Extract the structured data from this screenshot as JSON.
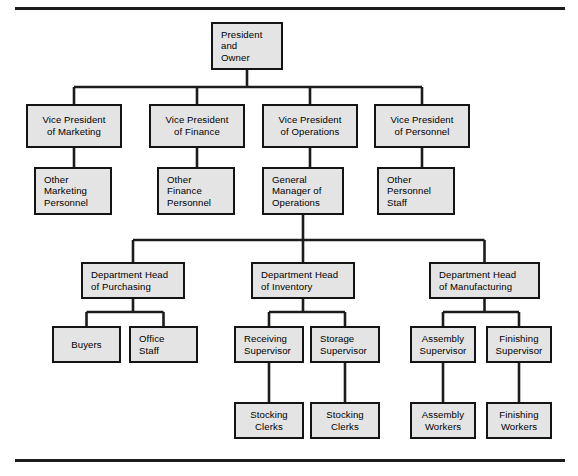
{
  "page": {
    "background": "#ffffff",
    "box_fill": "#e4e4e4",
    "box_stroke": "#141414",
    "line_color": "#1c1c1c",
    "text_color": "#000000"
  },
  "rules": [
    {
      "name": "top-rule",
      "x": 15,
      "y": 7,
      "width": 550,
      "height": 3
    },
    {
      "name": "bottom-rule",
      "x": 15,
      "y": 459,
      "width": 550,
      "height": 3
    }
  ],
  "chart_data": {
    "type": "diagram",
    "diagram_type": "organization-chart",
    "orientation": "top-down",
    "levels": 6,
    "node_count": 22,
    "nodes": [
      {
        "id": "president",
        "label_lines": [
          "President",
          "and",
          "Owner"
        ],
        "align": "left",
        "x": 211,
        "y": 22,
        "w": 72,
        "h": 48,
        "level": 0
      },
      {
        "id": "vp-marketing",
        "label_lines": [
          "Vice President",
          "of Marketing"
        ],
        "align": "center",
        "x": 26,
        "y": 104,
        "w": 96,
        "h": 44,
        "level": 1
      },
      {
        "id": "vp-finance",
        "label_lines": [
          "Vice President",
          "of Finance"
        ],
        "align": "center",
        "x": 149,
        "y": 104,
        "w": 96,
        "h": 44,
        "level": 1
      },
      {
        "id": "vp-operations",
        "label_lines": [
          "Vice President",
          "of Operations"
        ],
        "align": "center",
        "x": 262,
        "y": 104,
        "w": 96,
        "h": 44,
        "level": 1
      },
      {
        "id": "vp-personnel",
        "label_lines": [
          "Vice President",
          "of Personnel"
        ],
        "align": "center",
        "x": 374,
        "y": 104,
        "w": 96,
        "h": 44,
        "level": 1
      },
      {
        "id": "other-marketing",
        "label_lines": [
          "Other",
          "Marketing",
          "Personnel"
        ],
        "align": "left",
        "x": 34,
        "y": 167,
        "w": 78,
        "h": 48,
        "level": 2
      },
      {
        "id": "other-finance",
        "label_lines": [
          "Other",
          "Finance",
          "Personnel"
        ],
        "align": "left",
        "x": 157,
        "y": 167,
        "w": 78,
        "h": 48,
        "level": 2
      },
      {
        "id": "gm-operations",
        "label_lines": [
          "General",
          "Manager of",
          "Operations"
        ],
        "align": "left",
        "x": 262,
        "y": 167,
        "w": 82,
        "h": 48,
        "level": 2
      },
      {
        "id": "other-personnel",
        "label_lines": [
          "Other",
          "Personnel",
          "Staff"
        ],
        "align": "left",
        "x": 377,
        "y": 167,
        "w": 78,
        "h": 48,
        "level": 2
      },
      {
        "id": "dh-purchasing",
        "label_lines": [
          "Department Head",
          "of Purchasing"
        ],
        "align": "left",
        "x": 81,
        "y": 262,
        "w": 104,
        "h": 37,
        "level": 3
      },
      {
        "id": "dh-inventory",
        "label_lines": [
          "Department Head",
          "of Inventory"
        ],
        "align": "left",
        "x": 251,
        "y": 262,
        "w": 104,
        "h": 37,
        "level": 3
      },
      {
        "id": "dh-manufacturing",
        "label_lines": [
          "Department Head",
          "of Manufacturing"
        ],
        "align": "left",
        "x": 429,
        "y": 262,
        "w": 111,
        "h": 37,
        "level": 3
      },
      {
        "id": "buyers",
        "label_lines": [
          "Buyers"
        ],
        "align": "center",
        "x": 52,
        "y": 326,
        "w": 69,
        "h": 37,
        "level": 4
      },
      {
        "id": "office-staff",
        "label_lines": [
          "Office",
          "Staff"
        ],
        "align": "left",
        "x": 129,
        "y": 326,
        "w": 69,
        "h": 37,
        "level": 4
      },
      {
        "id": "receiving-sup",
        "label_lines": [
          "Receiving",
          "Supervisor"
        ],
        "align": "left",
        "x": 234,
        "y": 326,
        "w": 70,
        "h": 37,
        "level": 4
      },
      {
        "id": "storage-sup",
        "label_lines": [
          "Storage",
          "Supervisor"
        ],
        "align": "left",
        "x": 310,
        "y": 326,
        "w": 70,
        "h": 37,
        "level": 4
      },
      {
        "id": "assembly-sup",
        "label_lines": [
          "Assembly",
          "Supervisor"
        ],
        "align": "center",
        "x": 410,
        "y": 326,
        "w": 66,
        "h": 37,
        "level": 4
      },
      {
        "id": "finishing-sup",
        "label_lines": [
          "Finishing",
          "Supervisor"
        ],
        "align": "center",
        "x": 486,
        "y": 326,
        "w": 66,
        "h": 37,
        "level": 4
      },
      {
        "id": "stocking-clerks-1",
        "label_lines": [
          "Stocking",
          "Clerks"
        ],
        "align": "center",
        "x": 234,
        "y": 402,
        "w": 70,
        "h": 37,
        "level": 5
      },
      {
        "id": "stocking-clerks-2",
        "label_lines": [
          "Stocking",
          "Clerks"
        ],
        "align": "center",
        "x": 310,
        "y": 402,
        "w": 70,
        "h": 37,
        "level": 5
      },
      {
        "id": "assembly-workers",
        "label_lines": [
          "Assembly",
          "Workers"
        ],
        "align": "center",
        "x": 410,
        "y": 402,
        "w": 66,
        "h": 37,
        "level": 5
      },
      {
        "id": "finishing-workers",
        "label_lines": [
          "Finishing",
          "Workers"
        ],
        "align": "center",
        "x": 486,
        "y": 402,
        "w": 66,
        "h": 37,
        "level": 5
      }
    ],
    "edges": [
      {
        "from": "president",
        "to": [
          "vp-marketing",
          "vp-finance",
          "vp-operations",
          "vp-personnel"
        ],
        "style": "orthogonal-bus",
        "bus_y": 87
      },
      {
        "from": "vp-marketing",
        "to": [
          "other-marketing"
        ],
        "style": "straight"
      },
      {
        "from": "vp-finance",
        "to": [
          "other-finance"
        ],
        "style": "straight"
      },
      {
        "from": "vp-operations",
        "to": [
          "gm-operations"
        ],
        "style": "straight"
      },
      {
        "from": "vp-personnel",
        "to": [
          "other-personnel"
        ],
        "style": "straight"
      },
      {
        "from": "gm-operations",
        "to": [
          "dh-purchasing",
          "dh-inventory",
          "dh-manufacturing"
        ],
        "style": "orthogonal-bus",
        "bus_y": 240
      },
      {
        "from": "dh-purchasing",
        "to": [
          "buyers",
          "office-staff"
        ],
        "style": "orthogonal-bus",
        "bus_y": 312
      },
      {
        "from": "dh-inventory",
        "to": [
          "receiving-sup",
          "storage-sup"
        ],
        "style": "orthogonal-bus",
        "bus_y": 312
      },
      {
        "from": "dh-manufacturing",
        "to": [
          "assembly-sup",
          "finishing-sup"
        ],
        "style": "orthogonal-bus",
        "bus_y": 312
      },
      {
        "from": "receiving-sup",
        "to": [
          "stocking-clerks-1"
        ],
        "style": "straight"
      },
      {
        "from": "storage-sup",
        "to": [
          "stocking-clerks-2"
        ],
        "style": "straight"
      },
      {
        "from": "assembly-sup",
        "to": [
          "assembly-workers"
        ],
        "style": "straight"
      },
      {
        "from": "finishing-sup",
        "to": [
          "finishing-workers"
        ],
        "style": "straight"
      }
    ]
  }
}
